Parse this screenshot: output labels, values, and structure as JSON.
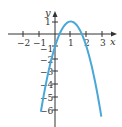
{
  "chart_data": {
    "type": "line",
    "title": "",
    "xlabel": "x",
    "ylabel": "y",
    "xlim": [
      -2.6,
      3.4
    ],
    "ylim": [
      -7,
      1.8
    ],
    "x_ticks": [
      -2,
      -1,
      1,
      2,
      3
    ],
    "y_ticks": [
      1,
      -1,
      -2,
      -3,
      -4,
      -5,
      -6
    ],
    "x_tick_labels": [
      "−2",
      "−1",
      "1",
      "2",
      "3"
    ],
    "y_tick_labels": [
      "1",
      "−1",
      "−2",
      "−3",
      "−4",
      "−5",
      "−6"
    ],
    "grid": false,
    "series": [
      {
        "name": "y = -2x^2 + 4x - 1",
        "color": "#4aa8d8",
        "x": [
          -0.9,
          -0.5,
          0,
          0.5,
          1,
          1.5,
          2,
          2.5,
          2.95
        ],
        "y": [
          -6.22,
          -3.5,
          -1,
          0.5,
          1,
          0.5,
          -1,
          -3.5,
          -6.6
        ]
      }
    ]
  }
}
